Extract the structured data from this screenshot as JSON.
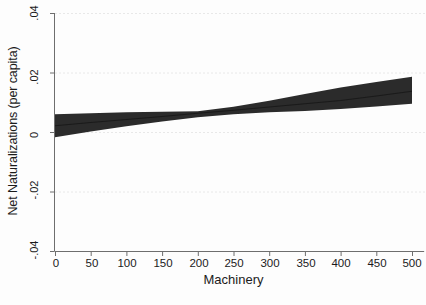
{
  "chart_data": {
    "type": "line",
    "title": "",
    "subtitle": "",
    "xlabel": "Machinery",
    "ylabel": "Net Naturalizations (per capita)",
    "xlim": [
      0,
      500
    ],
    "ylim": [
      -0.04,
      0.04
    ],
    "xticks": [
      0,
      50,
      100,
      150,
      200,
      250,
      300,
      350,
      400,
      450,
      500
    ],
    "xtick_labels": [
      "0",
      "50",
      "100",
      "150",
      "200",
      "250",
      "300",
      "350",
      "400",
      "450",
      "500"
    ],
    "yticks": [
      0.04,
      0.02,
      0,
      -0.02,
      -0.04
    ],
    "ytick_labels": [
      ".04",
      ".02",
      "0",
      "-.02",
      "-.04"
    ],
    "grid": "horizontal-dotted-light",
    "legend": "none",
    "series": [
      {
        "name": "Predicted margin (fit line)",
        "kind": "line",
        "color": "#1a1a1a",
        "x": [
          0,
          50,
          100,
          150,
          200,
          250,
          300,
          350,
          400,
          450,
          500
        ],
        "values": [
          0.0021,
          0.0032,
          0.0042,
          0.0052,
          0.0063,
          0.0073,
          0.0084,
          0.0095,
          0.0106,
          0.0121,
          0.0137
        ]
      },
      {
        "name": "95% confidence interval (shaded band)",
        "kind": "band",
        "color": "#2b2b2b",
        "x": [
          0,
          50,
          100,
          150,
          200,
          250,
          300,
          350,
          400,
          450,
          500
        ],
        "upper": [
          0.006,
          0.0063,
          0.0066,
          0.0068,
          0.007,
          0.0085,
          0.0105,
          0.0128,
          0.015,
          0.0168,
          0.0186
        ],
        "lower": [
          -0.0018,
          0.0002,
          0.0019,
          0.0035,
          0.005,
          0.006,
          0.0066,
          0.0071,
          0.0077,
          0.0086,
          0.0095
        ]
      }
    ],
    "annotations": [
      {
        "text": "zero reference gridline",
        "y": 0
      }
    ]
  },
  "axes": {
    "y_title": "Net Naturalizations (per capita)",
    "x_title": "Machinery",
    "ytick_labels": [
      ".04",
      ".02",
      "0",
      "-.02",
      "-.04"
    ],
    "xtick_labels": [
      "0",
      "50",
      "100",
      "150",
      "200",
      "250",
      "300",
      "350",
      "400",
      "450",
      "500"
    ]
  },
  "colors": {
    "band": "#2b2b2b",
    "fit_line": "#111111",
    "axis": "#6e6e6e",
    "gridline": "#e8e8e8",
    "text": "#1b1b1b",
    "background": "#fdfdfd"
  }
}
